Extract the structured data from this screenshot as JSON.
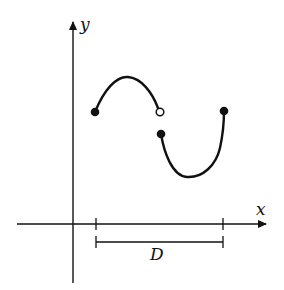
{
  "figure": {
    "type": "function-graph",
    "axes": {
      "x_label": "x",
      "y_label": "y"
    },
    "domain_label": "D",
    "colors": {
      "stroke": "#111111",
      "background": "#ffffff"
    },
    "curve_pieces": [
      {
        "name": "upper-arc",
        "shape": "concave-down arc",
        "start": {
          "x": 95,
          "y": 112,
          "endpoint": "closed"
        },
        "end": {
          "x": 160,
          "y": 112,
          "endpoint": "open"
        }
      },
      {
        "name": "lower-arc",
        "shape": "concave-up arc",
        "start": {
          "x": 161,
          "y": 134,
          "endpoint": "closed"
        },
        "end": {
          "x": 224,
          "y": 111,
          "endpoint": "closed"
        }
      }
    ]
  }
}
